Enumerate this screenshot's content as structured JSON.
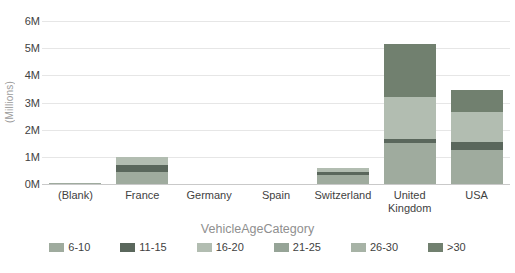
{
  "chart_data": {
    "type": "bar",
    "stacked": true,
    "title": "",
    "xlabel": "",
    "ylabel": "(Millions)",
    "ylim": [
      0,
      6
    ],
    "y_ticks": [
      "0M",
      "1M",
      "2M",
      "3M",
      "4M",
      "5M",
      "6M"
    ],
    "grid": true,
    "legend_position": "bottom",
    "legend_title": "VehicleAgeCategory",
    "categories": [
      "(Blank)",
      "France",
      "Germany",
      "Spain",
      "Switzerland",
      "United Kingdom",
      "USA"
    ],
    "series": [
      {
        "name": "6-10",
        "color": "#9fab9e",
        "values": [
          0.05,
          0.45,
          0,
          0,
          0.35,
          1.5,
          1.25
        ]
      },
      {
        "name": "11-15",
        "color": "#5a675c",
        "values": [
          0,
          0.25,
          0,
          0,
          0.1,
          0.15,
          0.3
        ]
      },
      {
        "name": "16-20",
        "color": "#b2bdb1",
        "values": [
          0,
          0.3,
          0,
          0,
          0.15,
          1.55,
          1.1
        ]
      },
      {
        "name": "21-25",
        "color": "#96a497",
        "values": [
          0,
          0,
          0,
          0,
          0,
          0,
          0
        ]
      },
      {
        "name": "26-30",
        "color": "#a7b3a6",
        "values": [
          0,
          0,
          0,
          0,
          0,
          0,
          0
        ]
      },
      {
        "name": ">30",
        "color": "#71806f",
        "values": [
          0,
          0,
          0,
          0,
          0,
          1.95,
          0.8
        ]
      }
    ],
    "colors": {
      "background": "#ffffff",
      "gridline": "#e6e6e6",
      "axis_line": "#c9c9c9",
      "tick_label": "#424242",
      "axis_title": "#9b9b9b",
      "legend_title_color": "#8f8f8f"
    }
  }
}
